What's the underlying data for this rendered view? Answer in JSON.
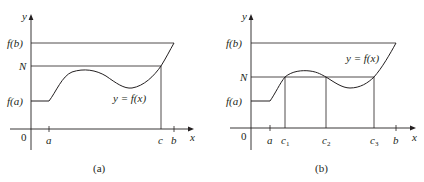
{
  "panels": [
    {
      "caption": "(a)",
      "y_axis_label": "y",
      "x_axis_label": "x",
      "origin_label": "0",
      "y_ticks": [
        "f(b)",
        "N",
        "f(a)"
      ],
      "x_ticks": [
        "a",
        "c",
        "b"
      ],
      "curve_label": "y = f(x)"
    },
    {
      "caption": "(b)",
      "y_axis_label": "y",
      "x_axis_label": "x",
      "origin_label": "0",
      "y_ticks": [
        "f(b)",
        "N",
        "f(a)"
      ],
      "x_ticks": [
        "a",
        "c1",
        "c2",
        "c3",
        "b"
      ],
      "curve_label": "y = f(x)"
    }
  ],
  "labels": {
    "fb": "f(b)",
    "N": "N",
    "fa": "f(a)",
    "y": "y",
    "x": "x",
    "zero": "0",
    "a": "a",
    "b": "b",
    "c": "c",
    "c_sub1": "1",
    "c_sub2": "2",
    "c_sub3": "3",
    "curve": "y = f(x)",
    "cap_a": "(a)",
    "cap_b": "(b)"
  }
}
